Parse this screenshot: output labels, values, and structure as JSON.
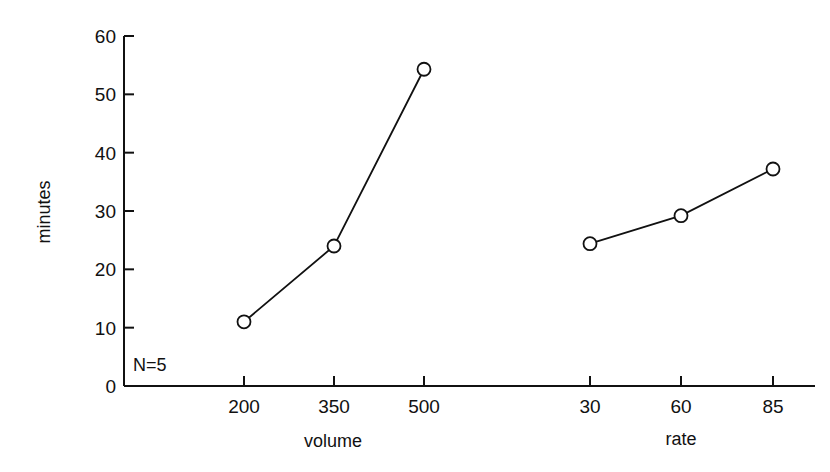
{
  "chart_data": {
    "type": "line",
    "title": "",
    "ylabel": "minutes",
    "ylim": [
      0,
      60
    ],
    "yticks": [
      0,
      10,
      20,
      30,
      40,
      50,
      60
    ],
    "grid": false,
    "legend": null,
    "annotation": "N=5",
    "panels": [
      {
        "xlabel": "volume",
        "categories": [
          "200",
          "350",
          "500"
        ],
        "series": [
          {
            "name": "volume",
            "values": [
              11,
              24,
              54.3
            ],
            "marker": "open-circle"
          }
        ]
      },
      {
        "xlabel": "rate",
        "categories": [
          "30",
          "60",
          "85"
        ],
        "series": [
          {
            "name": "rate",
            "values": [
              24.4,
              29.2,
              37.2
            ],
            "marker": "open-circle"
          }
        ]
      }
    ]
  }
}
